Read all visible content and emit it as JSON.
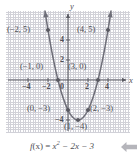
{
  "figure": {
    "caption_f": "f",
    "caption_of_x": "(x) =",
    "caption_x": "x",
    "caption_exp": "2",
    "caption_rest": "− 2x − 3",
    "caption_full": "f(x) = x² − 2x − 3",
    "axis_x_label": "x",
    "axis_y_label": "y",
    "curve_color": "#6e6e78",
    "grid_color": "#b9b9c4",
    "axis_color": "#5a5a62",
    "text_color": "#4f4f55",
    "pointer_color": "#b5b5bb"
  },
  "chart_data": {
    "type": "line",
    "xlabel": "x",
    "ylabel": "y",
    "xlim": [
      -5,
      5
    ],
    "ylim": [
      -5.5,
      6.5
    ],
    "grid": true,
    "legend": "none",
    "function": "f(x) = x^2 - 2x - 3",
    "x_ticks": [
      -4,
      -2,
      0,
      2,
      4
    ],
    "x_tick_labels": [
      "−4",
      "−2",
      "0",
      "2",
      "4"
    ],
    "y_ticks": [
      4,
      2,
      -4
    ],
    "y_tick_labels": [
      "4",
      "2",
      "−4"
    ],
    "series": [
      {
        "name": "f(x) = x² − 2x − 3",
        "x": [
          -2.3,
          -2,
          -1.5,
          -1,
          -0.5,
          0,
          0.5,
          1,
          1.5,
          2,
          2.5,
          3,
          3.5,
          4,
          4.3
        ],
        "y": [
          6.89,
          5,
          2.25,
          0,
          -1.75,
          -3,
          -3.75,
          -4,
          -3.75,
          -3,
          -1.75,
          0,
          2.25,
          5,
          6.89
        ]
      }
    ],
    "points": [
      {
        "x": -2,
        "y": 5,
        "label": "(−2, 5)",
        "label_pos": "left"
      },
      {
        "x": -1,
        "y": 0,
        "label": "(−1, 0)",
        "label_pos": "above-left"
      },
      {
        "x": 0,
        "y": -3,
        "label": "(0, −3)",
        "label_pos": "left"
      },
      {
        "x": 1,
        "y": -4,
        "label": "(1, −4)",
        "label_pos": "below"
      },
      {
        "x": 2,
        "y": -3,
        "label": "(2, −3)",
        "label_pos": "right"
      },
      {
        "x": 3,
        "y": 0,
        "label": "(3, 0)",
        "label_pos": "above-right"
      },
      {
        "x": 4,
        "y": 5,
        "label": "(4, 5)",
        "label_pos": "left"
      }
    ],
    "annotations": []
  },
  "labels": {
    "p_neg2_5": "(−2, 5)",
    "p_4_5": "(4, 5)",
    "p_neg1_0": "(−1, 0)",
    "p_3_0": "(3, 0)",
    "p_0_neg3": "(0, −3)",
    "p_2_neg3": "(2, −3)",
    "p_1_neg4": "(1, −4)"
  },
  "ticks": {
    "x_neg4": "−4",
    "x_neg2": "−2",
    "x_0": "0",
    "x_2": "2",
    "x_4": "4",
    "y_4": "4",
    "y_2": "2",
    "y_neg4": "−4"
  }
}
